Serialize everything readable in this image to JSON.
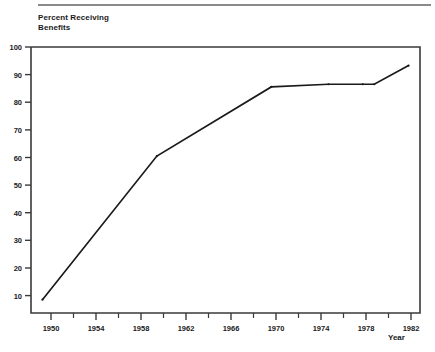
{
  "chart_data": {
    "type": "line",
    "title": "",
    "ylabel": "Percent Receiving\nBenefits",
    "xlabel": "Year",
    "x": [
      1950,
      1960,
      1970,
      1975,
      1978,
      1979,
      1982
    ],
    "values": [
      8,
      62,
      88,
      89,
      89,
      89,
      96
    ],
    "series": [
      {
        "name": "Percent Receiving Benefits",
        "points": [
          {
            "x": 1950,
            "y": 8
          },
          {
            "x": 1960,
            "y": 62
          },
          {
            "x": 1970,
            "y": 88
          },
          {
            "x": 1975,
            "y": 89
          },
          {
            "x": 1978,
            "y": 89
          },
          {
            "x": 1979,
            "y": 89
          },
          {
            "x": 1982,
            "y": 96
          }
        ]
      }
    ],
    "xlim": [
      1949,
      1983
    ],
    "ylim": [
      3,
      103
    ],
    "xticks": [
      1950,
      1954,
      1958,
      1962,
      1966,
      1970,
      1974,
      1978,
      1982
    ],
    "xticklabels": [
      "1950",
      "1954",
      "1958",
      "1962",
      "1966",
      "1970",
      "1974",
      "1978",
      "1982"
    ],
    "xminorticks": [
      1952,
      1956,
      1960,
      1964,
      1968,
      1972,
      1976,
      1980
    ],
    "yticks": [
      10,
      20,
      30,
      40,
      50,
      60,
      70,
      80,
      90,
      100
    ],
    "yticklabels": [
      "10",
      "20",
      "30",
      "40",
      "50",
      "60",
      "70",
      "80",
      "90",
      "100"
    ],
    "grid": false,
    "legend": "none",
    "line_color": "#1a1a1a",
    "axis_color": "#3a3a3a",
    "background_color": "#ffffff"
  },
  "figure": {
    "y_axis_title_line1": "Percent Receiving",
    "y_axis_title_line2": "Benefits",
    "x_axis_title": "Year"
  }
}
